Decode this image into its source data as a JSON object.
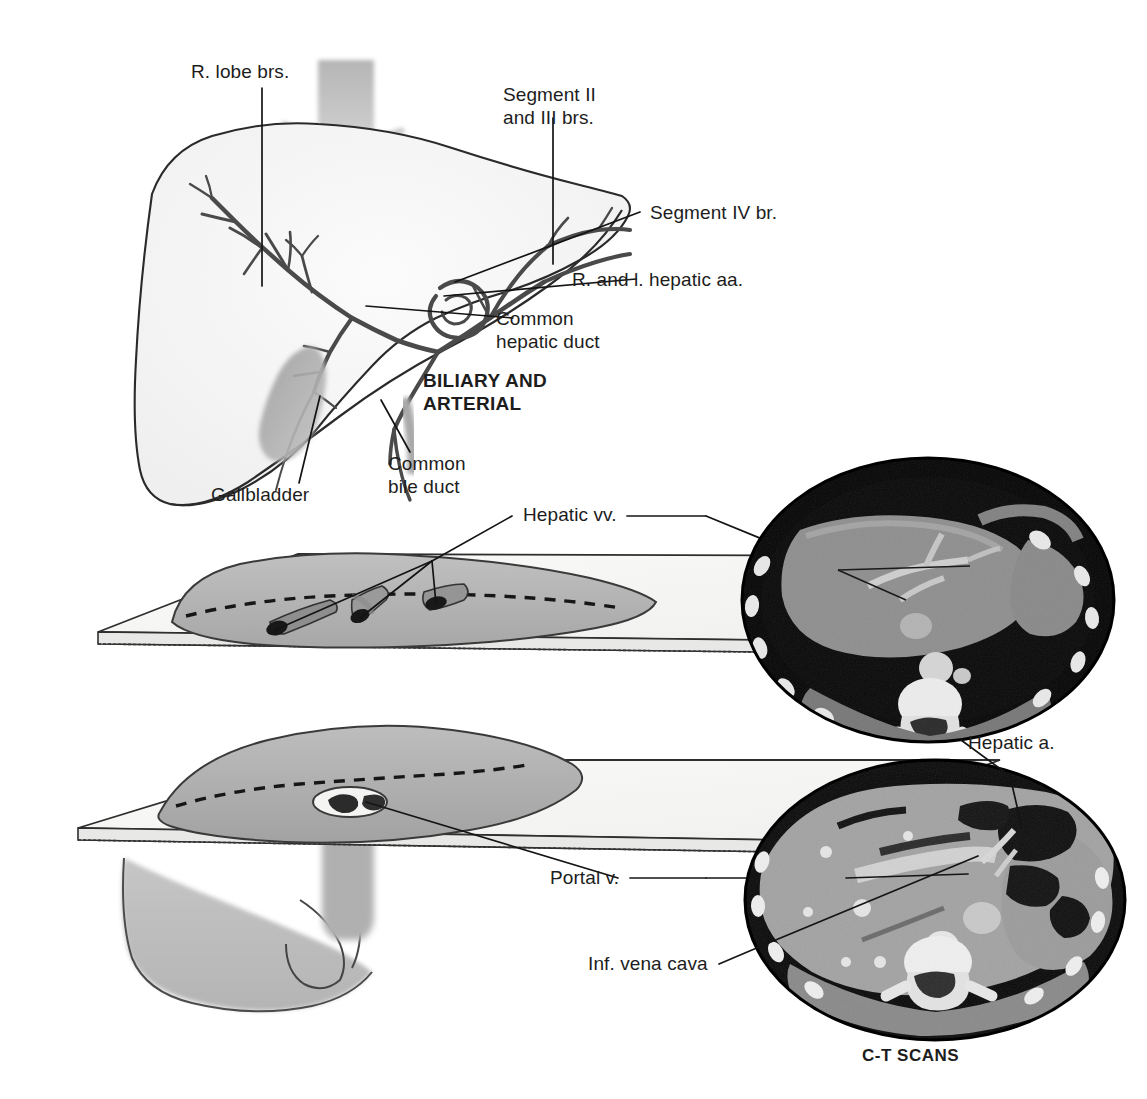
{
  "figure": {
    "domain": "anatomical-illustration",
    "background_color": "#ffffff",
    "ink_color": "#1a1a1a"
  },
  "panels": {
    "biliary_arterial": {
      "caption_line1": "BILIARY AND",
      "caption_line2": "ARTERIAL",
      "labels": [
        {
          "id": "r-lobe-brs",
          "text": "R. lobe brs."
        },
        {
          "id": "segment-ii-iii",
          "text_line1": "Segment II",
          "text_line2": "and III brs."
        },
        {
          "id": "segment-iv-br",
          "text": "Segment IV br."
        },
        {
          "id": "r-and-l-hepatic-aa",
          "text": "R. and l. hepatic aa."
        },
        {
          "id": "common-hepatic-duct",
          "text_line1": "Common",
          "text_line2": "hepatic duct"
        },
        {
          "id": "common-bile-duct",
          "text_line1": "Common",
          "text_line2": "bile duct"
        },
        {
          "id": "gallbladder",
          "text": "Gallbladder"
        }
      ]
    },
    "sectional_planes": {
      "labels": [
        {
          "id": "hepatic-vv",
          "text": "Hepatic vv."
        },
        {
          "id": "portal-v",
          "text": "Portal v."
        }
      ],
      "plane_count": 2,
      "vein_openings_upper": 3,
      "vein_openings_lower": 2
    },
    "ct_scans": {
      "caption": "C-T SCANS",
      "scan_count": 2,
      "labels": [
        {
          "id": "hepatic-a",
          "text": "Hepatic a."
        },
        {
          "id": "inf-vena-cava",
          "text": "Inf. vena cava"
        }
      ]
    }
  },
  "colors": {
    "liver_tint": "#b9b9b9",
    "gallbladder_tint": "#9d9d9d",
    "plane_tint": "#f2f2f0",
    "ct_background": "#0a0a0a",
    "ct_soft_tissue": "#9a9a9a",
    "ct_bone": "#ededed"
  }
}
